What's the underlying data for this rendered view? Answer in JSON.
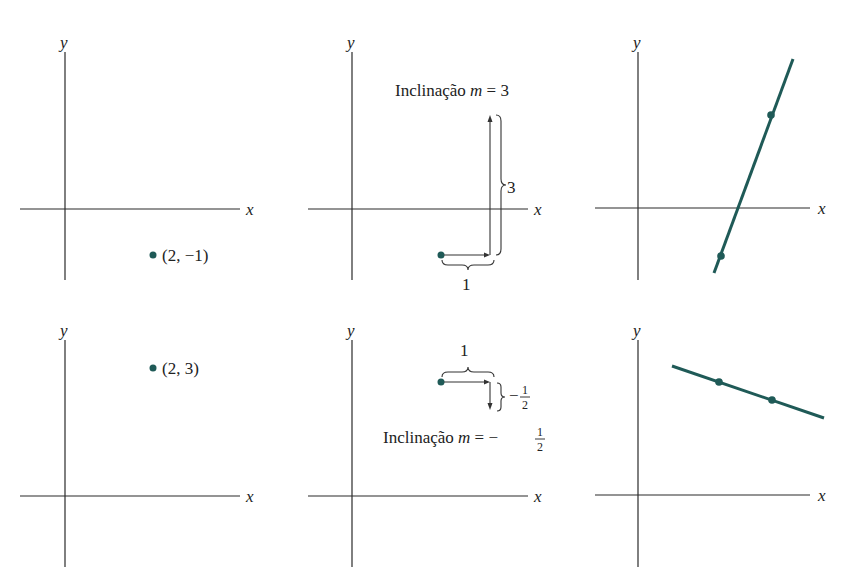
{
  "colors": {
    "accent": "#1f5a57",
    "axis": "#2b2b2b",
    "text": "#222222"
  },
  "axes": {
    "x_label": "x",
    "y_label": "y"
  },
  "panels": {
    "top_left": {
      "point_label": "(2, −1)"
    },
    "top_middle": {
      "slope_title": "Inclinação",
      "slope_var": "m",
      "slope_eq": "= 3",
      "rise_label": "3",
      "run_label": "1"
    },
    "top_right": {},
    "bottom_left": {
      "point_label": "(2, 3)"
    },
    "bottom_middle": {
      "slope_title": "Inclinação",
      "slope_var": "m",
      "slope_eq": "= −",
      "slope_num": "1",
      "slope_den": "2",
      "rise_label": "−",
      "rise_num": "1",
      "rise_den": "2",
      "run_label": "1"
    },
    "bottom_right": {}
  }
}
